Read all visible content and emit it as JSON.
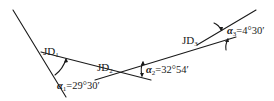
{
  "diagram": {
    "type": "route-alignment-intersection-points",
    "colors": {
      "line": "#1a1a1a",
      "background": "#ffffff"
    },
    "points": [
      {
        "id": "JD1",
        "label_main": "JD",
        "label_sub": "1"
      },
      {
        "id": "JD2",
        "label_main": "JD",
        "label_sub": "2"
      },
      {
        "id": "JD3",
        "label_main": "JD",
        "label_sub": "3"
      }
    ],
    "angles": [
      {
        "symbol": "α",
        "sub": "1",
        "value": "=29°30′"
      },
      {
        "symbol": "α",
        "sub": "2",
        "value": "=32°54′"
      },
      {
        "symbol": "α",
        "sub": "3",
        "value": "=4°30′"
      }
    ]
  }
}
